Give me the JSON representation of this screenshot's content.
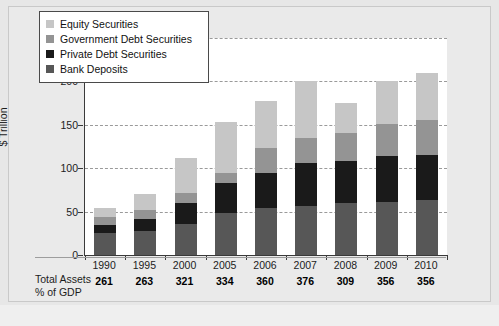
{
  "chart_data": {
    "type": "bar",
    "stacked": true,
    "title": "",
    "subtitle": "",
    "xlabel": "",
    "ylabel": "$ Trillion",
    "ylim": [
      0,
      250
    ],
    "yticks": [
      0,
      50,
      100,
      150,
      200,
      250
    ],
    "grid": true,
    "legend_position": "top-left",
    "categories": [
      "1990",
      "1995",
      "2000",
      "2005",
      "2006",
      "2007",
      "2008",
      "2009",
      "2010"
    ],
    "series": [
      {
        "name": "Bank Deposits",
        "color": "#575757",
        "values": [
          25,
          28,
          36,
          48,
          54,
          57,
          60,
          61,
          63
        ]
      },
      {
        "name": "Private Debt Securities",
        "color": "#1a1a1a",
        "values": [
          10,
          13,
          24,
          35,
          41,
          49,
          48,
          53,
          52
        ]
      },
      {
        "name": "Government Debt Securities",
        "color": "#949494",
        "values": [
          9,
          11,
          11,
          12,
          28,
          29,
          33,
          37,
          40
        ]
      },
      {
        "name": "Equity Securities",
        "color": "#c6c6c6",
        "values": [
          10,
          18,
          41,
          58,
          55,
          66,
          34,
          49,
          55
        ]
      }
    ],
    "totals": [
      54,
      70,
      112,
      153,
      178,
      201,
      175,
      200,
      210
    ],
    "annotations": {
      "footer_label_line1": "Total Assets",
      "footer_label_line2": "% of GDP",
      "footer_values": [
        "261",
        "263",
        "321",
        "334",
        "360",
        "376",
        "309",
        "356",
        "356"
      ]
    }
  },
  "legend": {
    "items": [
      {
        "label": "Equity Securities",
        "color": "#c6c6c6"
      },
      {
        "label": "Government Debt Securities",
        "color": "#949494"
      },
      {
        "label": "Private Debt Securities",
        "color": "#1a1a1a"
      },
      {
        "label": "Bank Deposits",
        "color": "#575757"
      }
    ]
  },
  "axes": {
    "y_title": "$ Trillion",
    "y_ticks": [
      "250",
      "200",
      "150",
      "100",
      "50",
      "0"
    ]
  },
  "colors": {
    "page_background": "#e7e7e7",
    "plot_background": "#ffffff",
    "axis": "#3a3a3a",
    "gridline": "#9a9a9a"
  }
}
